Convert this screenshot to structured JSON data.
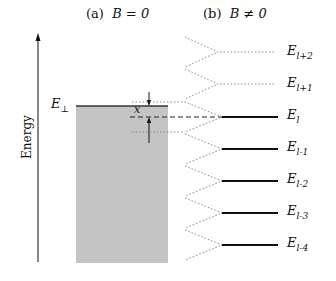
{
  "panels": {
    "a": {
      "tag": "(a)",
      "condition": "B = 0"
    },
    "b": {
      "tag": "(b)",
      "condition": "B ≠ 0"
    }
  },
  "axis": {
    "label": "Energy"
  },
  "edge": {
    "symbol": "E",
    "sub": "⊥"
  },
  "gap_label": "x",
  "levels": [
    {
      "symbol": "E",
      "sub": "l+2",
      "style": "dotted"
    },
    {
      "symbol": "E",
      "sub": "l+1",
      "style": "dotted"
    },
    {
      "symbol": "E",
      "sub": "l",
      "style": "solid"
    },
    {
      "symbol": "E",
      "sub": "l-1",
      "style": "solid"
    },
    {
      "symbol": "E",
      "sub": "l-2",
      "style": "solid"
    },
    {
      "symbol": "E",
      "sub": "l-3",
      "style": "solid"
    },
    {
      "symbol": "E",
      "sub": "l-4",
      "style": "solid"
    }
  ],
  "colors": {
    "band_fill": "#c4c4c4",
    "line": "#111111",
    "dotted": "#888888"
  }
}
